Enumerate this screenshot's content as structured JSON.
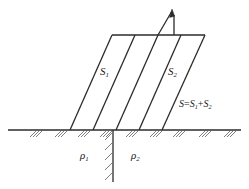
{
  "figure": {
    "type": "technical-diagram",
    "title": "",
    "background_color": "#ffffff",
    "line_color": "#2b2b2b",
    "hatch_color": "#6e6e6e",
    "width": 249,
    "height": 189
  },
  "labels": {
    "s1": {
      "symbol": "S",
      "sub": "1",
      "text": "S1"
    },
    "s2": {
      "symbol": "S",
      "sub": "2",
      "text": "S2"
    },
    "sum": {
      "text": "S=S1+S2",
      "lhs": "S",
      "op1": "=",
      "a": "S",
      "a_sub": "1",
      "op2": "+",
      "b": "S",
      "b_sub": "2"
    },
    "rho1": {
      "symbol": "ρ",
      "sub": "1",
      "text": "ρ1"
    },
    "rho2": {
      "symbol": "ρ",
      "sub": "2",
      "text": "ρ2"
    }
  },
  "geometry": {
    "ground_line": {
      "x1": 8,
      "y1": 130,
      "x2": 241,
      "y2": 130
    },
    "top_line": {
      "x1": 112,
      "y1": 35,
      "x2": 205,
      "y2": 35
    },
    "interface_line": {
      "x": 113,
      "y_top": 130,
      "y_bottom": 182
    },
    "arrow": {
      "x1": 158,
      "y1": 35,
      "x2": 172,
      "y2": 10,
      "tip_x": 172,
      "tip_y": 10
    },
    "arrow_stem": {
      "x": 174,
      "y_top": 14,
      "y_bottom": 35
    },
    "slant_lines": [
      {
        "x_bottom": 70,
        "x_top": 112
      },
      {
        "x_bottom": 93,
        "x_top": 135
      },
      {
        "x_bottom": 116,
        "x_top": 158
      },
      {
        "x_bottom": 139,
        "x_top": 181
      },
      {
        "x_bottom": 162,
        "x_top": 205
      }
    ],
    "ground_hatch_x": [
      30,
      55,
      78,
      100,
      126,
      150,
      173,
      199,
      224
    ],
    "interface_hatch_y": [
      136,
      146,
      156,
      166,
      176
    ]
  }
}
